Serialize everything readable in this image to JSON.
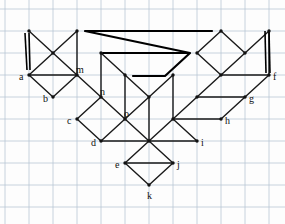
{
  "diagram": {
    "type": "node-link-diagram",
    "width": 285,
    "height": 224,
    "colors": {
      "background": "#fdfdfd",
      "grid": "#b9c6d4",
      "edge": "#1a1a1a",
      "node": "#111111",
      "label": "#101010",
      "bold_path": "#000000"
    },
    "grid": {
      "visible": true,
      "x_lines": [
        5,
        29,
        53,
        77,
        101,
        125,
        149,
        173,
        197,
        221,
        245,
        269
      ],
      "y_lines": [
        9,
        31,
        53,
        75,
        97,
        119,
        141,
        163,
        185,
        207
      ],
      "stroke_width": 0.8
    },
    "nodes": [
      {
        "id": "a",
        "x": 29,
        "y": 75,
        "label": "a",
        "label_dx": -10,
        "label_dy": 3,
        "labeled": true
      },
      {
        "id": "b",
        "x": 53,
        "y": 97,
        "label": "b",
        "label_dx": -10,
        "label_dy": 3,
        "labeled": true
      },
      {
        "id": "c",
        "x": 77,
        "y": 119,
        "label": "c",
        "label_dx": -10,
        "label_dy": 3,
        "labeled": true
      },
      {
        "id": "d",
        "x": 101,
        "y": 141,
        "label": "d",
        "label_dx": -10,
        "label_dy": 3,
        "labeled": true
      },
      {
        "id": "e",
        "x": 125,
        "y": 163,
        "label": "e",
        "label_dx": -10,
        "label_dy": 3,
        "labeled": true
      },
      {
        "id": "f",
        "x": 269,
        "y": 75,
        "label": "f",
        "label_dx": 4,
        "label_dy": 3,
        "labeled": true
      },
      {
        "id": "g",
        "x": 245,
        "y": 97,
        "label": "g",
        "label_dx": 4,
        "label_dy": 3,
        "labeled": true
      },
      {
        "id": "h",
        "x": 221,
        "y": 119,
        "label": "h",
        "label_dx": 4,
        "label_dy": 3,
        "labeled": true
      },
      {
        "id": "i",
        "x": 197,
        "y": 141,
        "label": "i",
        "label_dx": 4,
        "label_dy": 3,
        "labeled": true
      },
      {
        "id": "j",
        "x": 173,
        "y": 163,
        "label": "j",
        "label_dx": 4,
        "label_dy": 3,
        "labeled": true
      },
      {
        "id": "k",
        "x": 149,
        "y": 185,
        "label": "k",
        "label_dx": -2,
        "label_dy": 12,
        "labeled": true
      },
      {
        "id": "m",
        "x": 77,
        "y": 75,
        "label": "m",
        "label_dx": -1,
        "label_dy": -4,
        "labeled": true
      },
      {
        "id": "n",
        "x": 101,
        "y": 97,
        "label": "n",
        "label_dx": -1,
        "label_dy": -4,
        "labeled": true
      },
      {
        "id": "o",
        "x": 125,
        "y": 119,
        "label": "o",
        "label_dx": -1,
        "label_dy": -4,
        "labeled": true
      },
      {
        "id": "t1",
        "x": 29,
        "y": 31,
        "label": "",
        "label_dx": 0,
        "label_dy": 0,
        "labeled": false
      },
      {
        "id": "t2",
        "x": 77,
        "y": 31,
        "label": "",
        "label_dx": 0,
        "label_dy": 0,
        "labeled": false
      },
      {
        "id": "t3",
        "x": 221,
        "y": 31,
        "label": "",
        "label_dx": 0,
        "label_dy": 0,
        "labeled": false
      },
      {
        "id": "t4",
        "x": 269,
        "y": 31,
        "label": "",
        "label_dx": 0,
        "label_dy": 0,
        "labeled": false
      },
      {
        "id": "p1",
        "x": 53,
        "y": 53,
        "label": "",
        "label_dx": 0,
        "label_dy": 0,
        "labeled": false
      },
      {
        "id": "p2",
        "x": 101,
        "y": 53,
        "label": "",
        "label_dx": 0,
        "label_dy": 0,
        "labeled": false
      },
      {
        "id": "p3",
        "x": 197,
        "y": 53,
        "label": "",
        "label_dx": 0,
        "label_dy": 0,
        "labeled": false
      },
      {
        "id": "p4",
        "x": 245,
        "y": 53,
        "label": "",
        "label_dx": 0,
        "label_dy": 0,
        "labeled": false
      },
      {
        "id": "q1",
        "x": 125,
        "y": 75,
        "label": "",
        "label_dx": 0,
        "label_dy": 0,
        "labeled": false
      },
      {
        "id": "q2",
        "x": 173,
        "y": 75,
        "label": "",
        "label_dx": 0,
        "label_dy": 0,
        "labeled": false
      },
      {
        "id": "q3",
        "x": 221,
        "y": 75,
        "label": "",
        "label_dx": 0,
        "label_dy": 0,
        "labeled": false
      },
      {
        "id": "r1",
        "x": 149,
        "y": 97,
        "label": "",
        "label_dx": 0,
        "label_dy": 0,
        "labeled": false
      },
      {
        "id": "r2",
        "x": 197,
        "y": 97,
        "label": "",
        "label_dx": 0,
        "label_dy": 0,
        "labeled": false
      },
      {
        "id": "s1",
        "x": 173,
        "y": 119,
        "label": "",
        "label_dx": 0,
        "label_dy": 0,
        "labeled": false
      },
      {
        "id": "u1",
        "x": 149,
        "y": 141,
        "label": "",
        "label_dx": 0,
        "label_dy": 0,
        "labeled": false
      }
    ],
    "edges": [
      {
        "from": "t1",
        "to": "p1",
        "style": "thin"
      },
      {
        "from": "p1",
        "to": "a",
        "style": "thin"
      },
      {
        "from": "p1",
        "to": "t2",
        "style": "thin"
      },
      {
        "from": "t2",
        "to": "m",
        "style": "thin"
      },
      {
        "from": "p1",
        "to": "m",
        "style": "thin"
      },
      {
        "from": "m",
        "to": "a",
        "style": "thin"
      },
      {
        "from": "a",
        "to": "b",
        "style": "thin"
      },
      {
        "from": "b",
        "to": "m",
        "style": "thin"
      },
      {
        "from": "m",
        "to": "n",
        "style": "thin"
      },
      {
        "from": "n",
        "to": "c",
        "style": "thin"
      },
      {
        "from": "c",
        "to": "d",
        "style": "thin"
      },
      {
        "from": "n",
        "to": "o",
        "style": "thin"
      },
      {
        "from": "o",
        "to": "d",
        "style": "thin"
      },
      {
        "from": "d",
        "to": "u1",
        "style": "thin"
      },
      {
        "from": "u1",
        "to": "o",
        "style": "thin"
      },
      {
        "from": "n",
        "to": "p2",
        "style": "thin"
      },
      {
        "from": "p2",
        "to": "q1",
        "style": "thin"
      },
      {
        "from": "q1",
        "to": "o",
        "style": "thin"
      },
      {
        "from": "q1",
        "to": "r1",
        "style": "thin"
      },
      {
        "from": "r1",
        "to": "o",
        "style": "thin"
      },
      {
        "from": "r1",
        "to": "u1",
        "style": "thin"
      },
      {
        "from": "q2",
        "to": "r1",
        "style": "thin"
      },
      {
        "from": "q2",
        "to": "s1",
        "style": "thin"
      },
      {
        "from": "s1",
        "to": "u1",
        "style": "thin"
      },
      {
        "from": "s1",
        "to": "r2",
        "style": "thin"
      },
      {
        "from": "r2",
        "to": "q3",
        "style": "thin"
      },
      {
        "from": "q3",
        "to": "p3",
        "style": "thin"
      },
      {
        "from": "p3",
        "to": "t3",
        "style": "thin"
      },
      {
        "from": "t3",
        "to": "p4",
        "style": "thin"
      },
      {
        "from": "p4",
        "to": "q3",
        "style": "thin"
      },
      {
        "from": "q3",
        "to": "f",
        "style": "thin"
      },
      {
        "from": "p4",
        "to": "t4",
        "style": "thin"
      },
      {
        "from": "t4",
        "to": "f",
        "style": "thin"
      },
      {
        "from": "f",
        "to": "g",
        "style": "thin"
      },
      {
        "from": "g",
        "to": "r2",
        "style": "thin"
      },
      {
        "from": "g",
        "to": "h",
        "style": "thin"
      },
      {
        "from": "h",
        "to": "s1",
        "style": "thin"
      },
      {
        "from": "s1",
        "to": "i",
        "style": "thin"
      },
      {
        "from": "i",
        "to": "u1",
        "style": "thin"
      },
      {
        "from": "u1",
        "to": "j",
        "style": "thin"
      },
      {
        "from": "j",
        "to": "e",
        "style": "thin"
      },
      {
        "from": "e",
        "to": "u1",
        "style": "thin"
      },
      {
        "from": "e",
        "to": "k",
        "style": "thin"
      },
      {
        "from": "k",
        "to": "j",
        "style": "thin"
      }
    ],
    "bold_vertical_lines": [
      {
        "name": "left-double-line",
        "x1": 25,
        "y1": 33,
        "x2": 27,
        "y2": 70
      },
      {
        "name": "left-double-line",
        "x1": 29,
        "y1": 33,
        "x2": 30,
        "y2": 70
      },
      {
        "name": "right-double-line",
        "x1": 265,
        "y1": 31,
        "x2": 266,
        "y2": 73
      },
      {
        "name": "right-double-line",
        "x1": 269,
        "y1": 31,
        "x2": 270,
        "y2": 73
      }
    ],
    "bold_zigzag_path": {
      "name": "bold-zigzag-path",
      "points": [
        [
          85,
          31
        ],
        [
          212,
          31
        ],
        [
          85,
          31
        ],
        [
          190,
          53
        ],
        [
          103,
          53
        ],
        [
          190,
          53
        ],
        [
          165,
          76
        ],
        [
          133,
          76
        ]
      ],
      "stroke_width": 2.2
    }
  }
}
